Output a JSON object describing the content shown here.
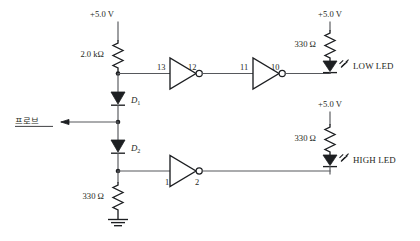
{
  "diagram": {
    "background_color": "#ffffff",
    "line_color": "#56585c",
    "component_color": "#1d1f22"
  },
  "supplies": {
    "top_left": "+5.0 V",
    "top_right": "+5.0 V",
    "mid_right": "+5.0 V"
  },
  "resistors": {
    "input_pullup": "2.0 kΩ",
    "low_led_series": "330 Ω",
    "high_led_series": "330 Ω",
    "pulldown": "330 Ω"
  },
  "diodes": {
    "d1": "D",
    "d1_sub": "1",
    "d2": "D",
    "d2_sub": "2"
  },
  "gates": [
    {
      "name": "inverter-1",
      "input_pin": "13",
      "output_pin": "12"
    },
    {
      "name": "inverter-2",
      "input_pin": "11",
      "output_pin": "10"
    },
    {
      "name": "inverter-3",
      "input_pin": "1",
      "output_pin": "2"
    }
  ],
  "leds": {
    "low": "LOW LED",
    "high": "HIGH LED"
  },
  "probe": {
    "label": "프로브"
  },
  "ground": {
    "label": ""
  }
}
